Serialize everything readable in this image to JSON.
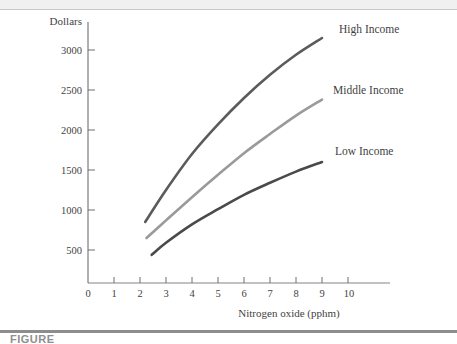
{
  "figure": {
    "caption_partial": "FIGURE",
    "background_color": "#ffffff"
  },
  "chart_data": {
    "type": "line",
    "title": "",
    "xlabel": "Nitrogen oxide (pphm)",
    "ylabel": "Dollars",
    "xlim": [
      0,
      11.2
    ],
    "ylim": [
      0,
      3400
    ],
    "xticks": [
      0,
      1,
      2,
      3,
      4,
      5,
      6,
      7,
      8,
      9,
      10
    ],
    "xtick_labels": [
      "0",
      "1",
      "2",
      "3",
      "4",
      "5",
      "6",
      "7",
      "8",
      "9",
      "10"
    ],
    "yticks": [
      500,
      1000,
      1500,
      2000,
      2500,
      3000
    ],
    "ytick_labels": [
      "500",
      "1000",
      "1500",
      "2000",
      "2500",
      "3000"
    ],
    "grid": false,
    "legend_position": "inline-right-of-curve-ends",
    "series": [
      {
        "name": "High Income",
        "color": "#5b5b5b",
        "line_width": 2.6,
        "x": [
          2.2,
          3.0,
          4.0,
          5.0,
          6.0,
          7.0,
          8.0,
          9.0
        ],
        "y": [
          850,
          1250,
          1700,
          2070,
          2400,
          2690,
          2940,
          3150
        ]
      },
      {
        "name": "Middle Income",
        "color": "#9a9a9a",
        "line_width": 2.6,
        "x": [
          2.25,
          3.0,
          4.0,
          5.0,
          6.0,
          7.0,
          8.0,
          9.0
        ],
        "y": [
          650,
          870,
          1160,
          1440,
          1710,
          1950,
          2180,
          2380
        ]
      },
      {
        "name": "Low Income",
        "color": "#4a4a4a",
        "line_width": 2.6,
        "x": [
          2.45,
          3.0,
          4.0,
          5.0,
          6.0,
          7.0,
          8.0,
          9.0
        ],
        "y": [
          440,
          590,
          820,
          1010,
          1190,
          1340,
          1480,
          1600
        ]
      }
    ],
    "annotations": [
      {
        "text": "High Income",
        "x_px": 339,
        "y_px": 33
      },
      {
        "text": "Middle Income",
        "x_px": 333,
        "y_px": 94
      },
      {
        "text": "Low Income",
        "x_px": 335,
        "y_px": 155
      }
    ]
  }
}
